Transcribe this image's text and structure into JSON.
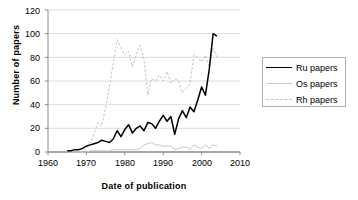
{
  "chart_data": {
    "type": "line",
    "title": "",
    "xlabel": "Date of publication",
    "ylabel": "Number of papers",
    "xlim": [
      1960,
      2010
    ],
    "ylim": [
      0,
      120
    ],
    "xticks": [
      "1960",
      "1970",
      "1980",
      "1990",
      "2000",
      "2010"
    ],
    "yticks": [
      "0",
      "20",
      "40",
      "60",
      "80",
      "100",
      "120"
    ],
    "grid": "horizontal",
    "legend_position": "right",
    "x": [
      1965,
      1966,
      1967,
      1968,
      1969,
      1970,
      1971,
      1972,
      1973,
      1974,
      1975,
      1976,
      1977,
      1978,
      1979,
      1980,
      1981,
      1982,
      1983,
      1984,
      1985,
      1986,
      1987,
      1988,
      1989,
      1990,
      1991,
      1992,
      1993,
      1994,
      1995,
      1996,
      1997,
      1998,
      1999,
      2000,
      2001,
      2002,
      2003,
      2004
    ],
    "series": [
      {
        "name": "Ru papers",
        "color": "#000000",
        "style": "solid",
        "values": [
          1,
          1,
          2,
          2,
          3,
          5,
          6,
          7,
          8,
          10,
          9,
          8,
          11,
          18,
          13,
          19,
          23,
          16,
          20,
          22,
          18,
          25,
          24,
          20,
          26,
          31,
          26,
          30,
          15,
          28,
          35,
          29,
          38,
          34,
          44,
          55,
          48,
          70,
          100,
          98
        ]
      },
      {
        "name": "Os papers",
        "color": "#c9c9c9",
        "style": "solid",
        "values": [
          0,
          0,
          0,
          0,
          0,
          0,
          1,
          1,
          1,
          1,
          1,
          1,
          2,
          2,
          2,
          2,
          2,
          2,
          2,
          3,
          6,
          7,
          8,
          6,
          6,
          5,
          5,
          5,
          2,
          3,
          4,
          4,
          2,
          6,
          4,
          3,
          6,
          3,
          6,
          5
        ]
      },
      {
        "name": "Rh papers",
        "color": "#c4c4c4",
        "style": "dashed",
        "values": [
          0,
          0,
          0,
          0,
          0,
          3,
          7,
          16,
          25,
          22,
          38,
          55,
          75,
          95,
          88,
          82,
          85,
          72,
          83,
          90,
          78,
          48,
          62,
          60,
          65,
          60,
          68,
          58,
          62,
          60,
          50,
          54,
          58,
          82,
          80,
          76,
          82,
          72,
          88,
          80
        ]
      }
    ]
  },
  "legend": {
    "items": [
      {
        "label": "Ru papers"
      },
      {
        "label": "Os papers"
      },
      {
        "label": "Rh papers"
      }
    ]
  }
}
